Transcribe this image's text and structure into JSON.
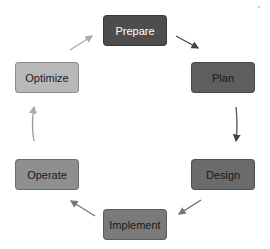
{
  "diagram": {
    "type": "cycle",
    "nodes": [
      {
        "id": "prepare",
        "label": "Prepare",
        "fill": "#4d4d4d",
        "text": "#ffffff"
      },
      {
        "id": "plan",
        "label": "Plan",
        "fill": "#5e5e5e",
        "text": "#1a1a1a"
      },
      {
        "id": "design",
        "label": "Design",
        "fill": "#6b6b6b",
        "text": "#1a1a1a"
      },
      {
        "id": "implement",
        "label": "Implement",
        "fill": "#7a7a7a",
        "text": "#1a1a1a"
      },
      {
        "id": "operate",
        "label": "Operate",
        "fill": "#8f8f8f",
        "text": "#1a1a1a"
      },
      {
        "id": "optimize",
        "label": "Optimize",
        "fill": "#b8b8b8",
        "text": "#1a1a1a"
      }
    ],
    "edges": [
      [
        "prepare",
        "plan"
      ],
      [
        "plan",
        "design"
      ],
      [
        "design",
        "implement"
      ],
      [
        "implement",
        "operate"
      ],
      [
        "operate",
        "optimize"
      ],
      [
        "optimize",
        "prepare"
      ]
    ]
  }
}
